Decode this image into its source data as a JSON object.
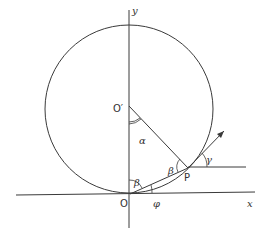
{
  "diagram": {
    "labels": {
      "y_axis": "y",
      "x_axis": "x",
      "origin": "O",
      "center": "O′",
      "point": "P",
      "alpha": "α",
      "beta_at_O": "β",
      "beta_at_P": "β",
      "gamma": "γ",
      "phi": "φ"
    },
    "elements": {
      "circle": {
        "cx": 129,
        "cy": 109,
        "r": 84
      },
      "x_axis": {
        "x1": 16,
        "y1": 195,
        "x2": 255,
        "y2": 192
      },
      "y_axis": {
        "x1": 129,
        "y1": 10,
        "x2": 129,
        "y2": 228
      },
      "radius_line": {
        "from": "O′",
        "to": "P"
      },
      "chord_line": {
        "from": "O",
        "to": "P"
      },
      "tangent_arrow": {
        "from": "P",
        "to": [
          224,
          131
        ]
      },
      "horizontal_from_P": {
        "x1": 188,
        "y1": 167,
        "x2": 246,
        "y2": 167
      }
    },
    "colors": {
      "stroke": "#3a3a3a",
      "text": "#333333",
      "background": "#ffffff"
    }
  }
}
